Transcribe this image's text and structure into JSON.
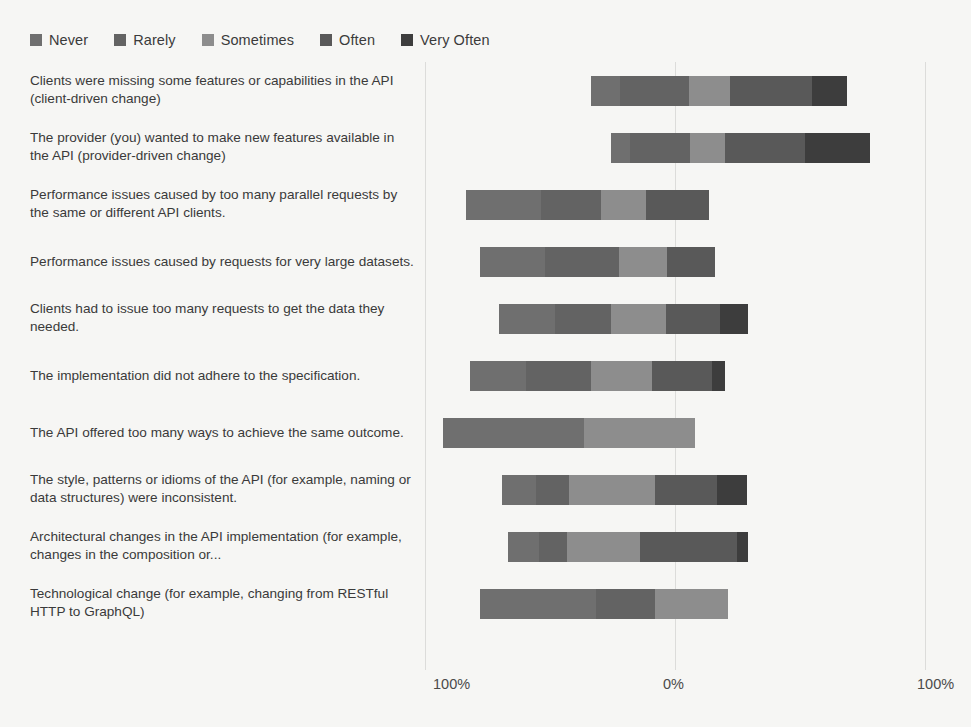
{
  "chart_data": {
    "type": "bar",
    "subtype": "diverging-stacked-likert",
    "title": "",
    "xlabel": "",
    "ylabel": "",
    "grid": true,
    "legend_position": "top-left",
    "axis": {
      "left_label": "100%",
      "center_label": "0%",
      "right_label": "100%",
      "xlim": [
        -100,
        100
      ],
      "ticks": [
        "100%",
        "0%",
        "100%"
      ]
    },
    "legend": [
      {
        "label": "Never",
        "color": "#6f6f6f"
      },
      {
        "label": "Rarely",
        "color": "#636363"
      },
      {
        "label": "Sometimes",
        "color": "#8d8d8d"
      },
      {
        "label": "Often",
        "color": "#595959"
      },
      {
        "label": "Very Often",
        "color": "#3d3d3d"
      }
    ],
    "series": [
      {
        "name": "Never",
        "color": "#6f6f6f",
        "values": [
          14,
          8,
          30,
          27,
          30,
          26,
          56,
          16,
          14,
          46
        ]
      },
      {
        "name": "Rarely",
        "color": "#636363",
        "values": [
          33,
          26,
          24,
          31,
          30,
          30,
          31,
          15,
          13,
          23
        ]
      },
      {
        "name": "Sometimes",
        "color": "#8d8d8d",
        "values": [
          20,
          15,
          18,
          20,
          29,
          28,
          44,
          40,
          33,
          29
        ]
      },
      {
        "name": "Often",
        "color": "#595959",
        "values": [
          39,
          34,
          25,
          20,
          29,
          28,
          0,
          29,
          44,
          29
        ]
      },
      {
        "name": "Very Often",
        "color": "#3d3d3d",
        "values": [
          17,
          28,
          0,
          0,
          15,
          6,
          0,
          14,
          5,
          0
        ]
      }
    ],
    "categories": [
      {
        "label": "Clients were missing some features or capabilities in the API (client-driven change)",
        "segments": [
          {
            "name": "Never",
            "value": 14,
            "color": "#6f6f6f"
          },
          {
            "name": "Rarely",
            "value": 33,
            "color": "#636363"
          },
          {
            "name": "Sometimes",
            "value": 20,
            "color": "#8d8d8d"
          },
          {
            "name": "Often",
            "value": 39,
            "color": "#595959"
          },
          {
            "name": "Very Often",
            "value": 17,
            "color": "#3d3d3d"
          }
        ],
        "start_pct": -33.6,
        "total_pct": 102.4
      },
      {
        "label": "The provider (you) wanted to make new features available in the API (provider-driven change)",
        "segments": [
          {
            "name": "Never",
            "value": 8,
            "color": "#6f6f6f"
          },
          {
            "name": "Rarely",
            "value": 26,
            "color": "#636363"
          },
          {
            "name": "Sometimes",
            "value": 15,
            "color": "#8d8d8d"
          },
          {
            "name": "Often",
            "value": 34,
            "color": "#595959"
          },
          {
            "name": "Very Often",
            "value": 28,
            "color": "#3d3d3d"
          }
        ],
        "start_pct": -25.6,
        "total_pct": 103.6
      },
      {
        "label": "Performance issues caused by too many parallel requests by the same or different API clients.",
        "segments": [
          {
            "name": "Never",
            "value": 30,
            "color": "#6f6f6f"
          },
          {
            "name": "Rarely",
            "value": 24,
            "color": "#636363"
          },
          {
            "name": "Sometimes",
            "value": 18,
            "color": "#8d8d8d"
          },
          {
            "name": "Often",
            "value": 25,
            "color": "#595959"
          }
        ],
        "start_pct": -83.6,
        "total_pct": 97.2
      },
      {
        "label": "Performance issues caused by requests for very large datasets.",
        "segments": [
          {
            "name": "Never",
            "value": 27,
            "color": "#6f6f6f"
          },
          {
            "name": "Rarely",
            "value": 31,
            "color": "#636363"
          },
          {
            "name": "Sometimes",
            "value": 20,
            "color": "#8d8d8d"
          },
          {
            "name": "Often",
            "value": 20,
            "color": "#595959"
          }
        ],
        "start_pct": -78.0,
        "total_pct": 94.0
      },
      {
        "label": "Clients had to issue too many requests to get the data they needed.",
        "segments": [
          {
            "name": "Never",
            "value": 30,
            "color": "#6f6f6f"
          },
          {
            "name": "Rarely",
            "value": 30,
            "color": "#636363"
          },
          {
            "name": "Sometimes",
            "value": 29,
            "color": "#8d8d8d"
          },
          {
            "name": "Often",
            "value": 29,
            "color": "#595959"
          },
          {
            "name": "Very Often",
            "value": 15,
            "color": "#3d3d3d"
          }
        ],
        "start_pct": -70.4,
        "total_pct": 99.6
      },
      {
        "label": "The implementation did not adhere to the specification.",
        "segments": [
          {
            "name": "Never",
            "value": 26,
            "color": "#6f6f6f"
          },
          {
            "name": "Rarely",
            "value": 30,
            "color": "#636363"
          },
          {
            "name": "Sometimes",
            "value": 28,
            "color": "#8d8d8d"
          },
          {
            "name": "Often",
            "value": 28,
            "color": "#595959"
          },
          {
            "name": "Very Often",
            "value": 6,
            "color": "#3d3d3d"
          }
        ],
        "start_pct": -82.0,
        "total_pct": 102.0
      },
      {
        "label": "The API offered too many ways to achieve the same outcome.",
        "segments": [
          {
            "name": "Never",
            "value": 56,
            "color": "#6f6f6f"
          },
          {
            "name": "Sometimes",
            "value": 44,
            "color": "#8d8d8d"
          }
        ],
        "start_pct": -92.8,
        "total_pct": 100.8
      },
      {
        "label": "The style, patterns or idioms of the API (for example, naming or data structures) were inconsistent.",
        "segments": [
          {
            "name": "Never",
            "value": 16,
            "color": "#6f6f6f"
          },
          {
            "name": "Rarely",
            "value": 15,
            "color": "#636363"
          },
          {
            "name": "Sometimes",
            "value": 40,
            "color": "#8d8d8d"
          },
          {
            "name": "Often",
            "value": 29,
            "color": "#595959"
          },
          {
            "name": "Very Often",
            "value": 14,
            "color": "#3d3d3d"
          }
        ],
        "start_pct": -69.2,
        "total_pct": 98.0
      },
      {
        "label": "Architectural changes in the API implementation (for example, changes in the composition or...",
        "segments": [
          {
            "name": "Never",
            "value": 14,
            "color": "#6f6f6f"
          },
          {
            "name": "Rarely",
            "value": 13,
            "color": "#636363"
          },
          {
            "name": "Sometimes",
            "value": 33,
            "color": "#8d8d8d"
          },
          {
            "name": "Often",
            "value": 44,
            "color": "#595959"
          },
          {
            "name": "Very Often",
            "value": 5,
            "color": "#3d3d3d"
          }
        ],
        "start_pct": -66.8,
        "total_pct": 96.0
      },
      {
        "label": "Technological change (for example, changing from RESTful HTTP to GraphQL)",
        "segments": [
          {
            "name": "Never",
            "value": 46,
            "color": "#6f6f6f"
          },
          {
            "name": "Rarely",
            "value": 23,
            "color": "#636363"
          },
          {
            "name": "Sometimes",
            "value": 29,
            "color": "#8d8d8d"
          }
        ],
        "start_pct": -78.0,
        "total_pct": 99.2
      }
    ]
  }
}
